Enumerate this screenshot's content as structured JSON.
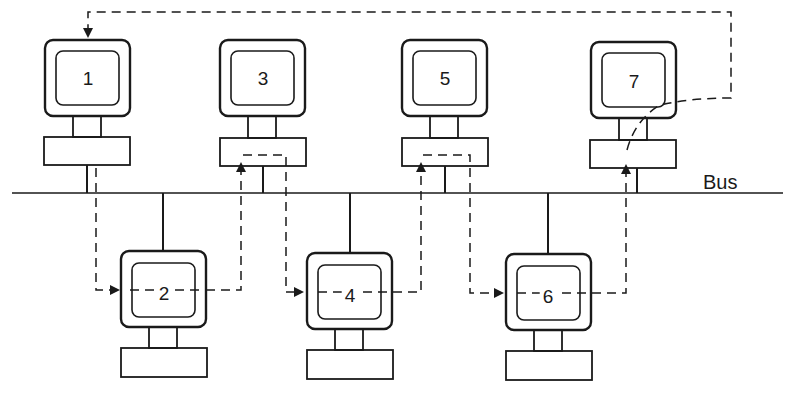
{
  "diagram": {
    "type": "token-bus network",
    "bus_label": "Bus",
    "colors": {
      "stroke": "#1a1a1a",
      "background": "#ffffff"
    },
    "nodes": [
      {
        "id": "1",
        "label": "1",
        "row": "top"
      },
      {
        "id": "2",
        "label": "2",
        "row": "bottom"
      },
      {
        "id": "3",
        "label": "3",
        "row": "top"
      },
      {
        "id": "4",
        "label": "4",
        "row": "bottom"
      },
      {
        "id": "5",
        "label": "5",
        "row": "top"
      },
      {
        "id": "6",
        "label": "6",
        "row": "bottom"
      },
      {
        "id": "7",
        "label": "7",
        "row": "top"
      }
    ],
    "token_path": [
      "1",
      "2",
      "3",
      "4",
      "5",
      "6",
      "7",
      "1"
    ]
  }
}
